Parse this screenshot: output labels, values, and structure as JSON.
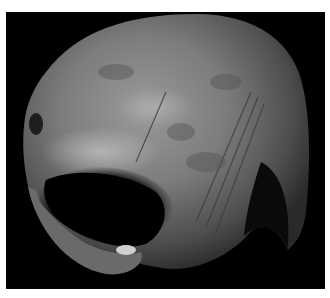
{
  "image": {
    "subject": "Phobos (moon of Mars), grayscale photograph",
    "background_color": "#000000",
    "border_color": "#ffffff"
  }
}
